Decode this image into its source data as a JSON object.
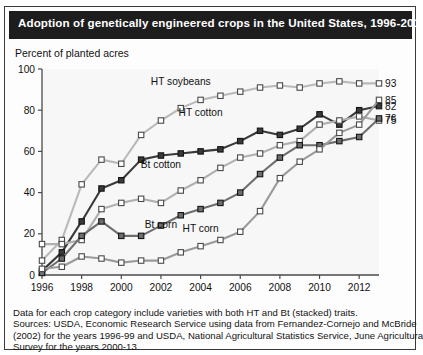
{
  "header": {
    "title": "Adoption of genetically engineered crops in the United States, 1996-2013"
  },
  "axis_note": "Percent of planted acres",
  "footnotes": {
    "line1": "Data for each crop category include varieties with both HT and Bt (stacked) traits.",
    "line2": "Sources: USDA, Economic Research Service using data from Fernandez-Cornejo and McBride",
    "line3": "(2002) for the years 1996-99 and USDA, National Agricultural Statistics Service, June Agricultural",
    "line4": "Survey for the years 2000-13."
  },
  "colors": {
    "title_bar": "#1d1d1d",
    "ht_soybeans": "#b9b9b9",
    "ht_cotton": "#3a3a3a",
    "bt_cotton": "#b0b0b0",
    "bt_corn": "#6e6e6e",
    "ht_corn": "#9a9a9a",
    "axis": "#4a4a4a",
    "plot_bg": "#f7f7f7"
  },
  "chart_data": {
    "type": "line",
    "title": "Adoption of genetically engineered crops in the United States, 1996-2013",
    "xlabel": "",
    "ylabel": "Percent of planted acres",
    "xlim": [
      1996,
      2013
    ],
    "ylim": [
      0,
      100
    ],
    "yticks": [
      0,
      20,
      40,
      60,
      80,
      100
    ],
    "xticks": [
      1996,
      1998,
      2000,
      2002,
      2004,
      2006,
      2008,
      2010,
      2012
    ],
    "xtick_labels": [
      "1996",
      "1998",
      "2000",
      "2002",
      "2004",
      "2006",
      "2008",
      "2010",
      "2012"
    ],
    "ytick_labels": [
      "0",
      "20",
      "40",
      "60",
      "80",
      "100"
    ],
    "grid": false,
    "legend": "inline-labels",
    "x": [
      1996,
      1997,
      1998,
      1999,
      2000,
      2001,
      2002,
      2003,
      2004,
      2005,
      2006,
      2007,
      2008,
      2009,
      2010,
      2011,
      2012,
      2013
    ],
    "series": [
      {
        "name": "HT soybeans",
        "color": "#b9b9b9",
        "marker": "open-square",
        "end_label": "93",
        "label_x": 2003,
        "label_y": 92,
        "values": [
          7,
          17,
          44,
          56,
          54,
          68,
          75,
          81,
          85,
          87,
          89,
          91,
          92,
          91,
          93,
          94,
          93,
          93
        ]
      },
      {
        "name": "HT cotton",
        "color": "#3a3a3a",
        "marker": "filled-square",
        "end_label": "82",
        "label_x": 2004,
        "label_y": 77,
        "values": [
          2,
          11,
          26,
          42,
          46,
          56,
          58,
          59,
          60,
          61,
          65,
          70,
          68,
          71,
          78,
          73,
          80,
          82
        ]
      },
      {
        "name": "Bt cotton",
        "color": "#b0b0b0",
        "marker": "open-square",
        "end_label": "75",
        "label_x": 2002,
        "label_y": 52,
        "values": [
          15,
          15,
          17,
          32,
          35,
          37,
          35,
          41,
          46,
          52,
          57,
          59,
          63,
          65,
          73,
          75,
          77,
          75
        ]
      },
      {
        "name": "Bt corn",
        "color": "#6e6e6e",
        "marker": "filled-square",
        "end_label": "76",
        "label_x": 2002,
        "label_y": 23,
        "values": [
          1,
          8,
          19,
          26,
          19,
          19,
          24,
          29,
          32,
          35,
          40,
          49,
          57,
          63,
          63,
          65,
          67,
          76
        ]
      },
      {
        "name": "HT corn",
        "color": "#9a9a9a",
        "marker": "open-square",
        "end_label": "85",
        "label_x": 2004,
        "label_y": 21,
        "values": [
          3,
          4,
          9,
          8,
          6,
          7,
          7,
          11,
          14,
          17,
          21,
          31,
          47,
          55,
          61,
          69,
          73,
          85
        ]
      }
    ]
  }
}
